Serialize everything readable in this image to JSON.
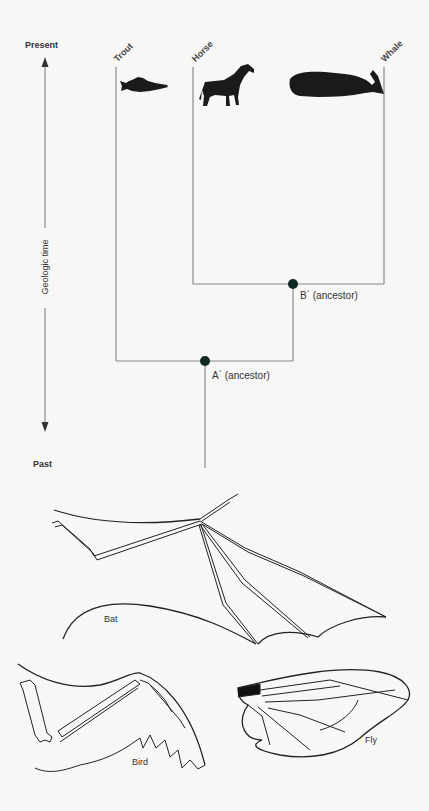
{
  "tree": {
    "axis": {
      "top_label": "Present",
      "bottom_label": "Past",
      "axis_label": "Geologic time"
    },
    "taxa": [
      {
        "name": "Trout",
        "icon": "fish-silhouette-icon"
      },
      {
        "name": "Horse",
        "icon": "horse-silhouette-icon"
      },
      {
        "name": "Whale",
        "icon": "whale-silhouette-icon"
      }
    ],
    "nodes": [
      {
        "id": "A",
        "label": "A´ (ancestor)"
      },
      {
        "id": "B",
        "label": "B´ (ancestor)"
      }
    ],
    "node_color": "#0f2a24",
    "line_color": "#888888"
  },
  "wings": [
    {
      "name": "Bat"
    },
    {
      "name": "Bird"
    },
    {
      "name": "Fly"
    }
  ]
}
